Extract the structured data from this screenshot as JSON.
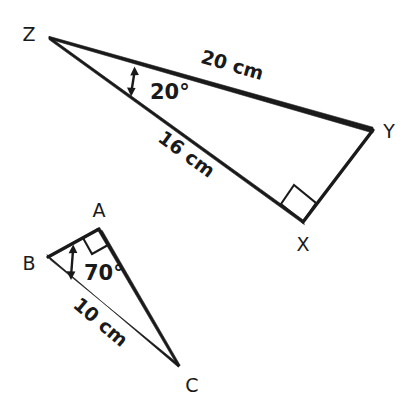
{
  "figure": {
    "background_color": "#ffffff",
    "ink_color": "#1a1a1a",
    "triangles": [
      {
        "id": "XYZ",
        "vertices": [
          {
            "name": "Z",
            "label": "Z",
            "x": 49,
            "y": 37,
            "label_x": 29,
            "label_y": 35
          },
          {
            "name": "Y",
            "label": "Y",
            "x": 373,
            "y": 130,
            "label_x": 389,
            "label_y": 132
          },
          {
            "name": "X",
            "label": "X",
            "x": 303,
            "y": 222,
            "label_x": 303,
            "label_y": 245
          }
        ],
        "sides": [
          {
            "from": "Z",
            "to": "Y",
            "label": "20 cm",
            "label_x": 232,
            "label_y": 66,
            "rotation": 16.0
          },
          {
            "from": "Z",
            "to": "X",
            "label": "16 cm",
            "label_x": 186,
            "label_y": 155,
            "rotation": 36.0
          },
          {
            "from": "X",
            "to": "Y",
            "label": "",
            "label_x": 0,
            "label_y": 0,
            "rotation": 0
          }
        ],
        "angles": [
          {
            "at": "Z",
            "label": "20°",
            "label_x": 150,
            "label_y": 93,
            "marker": "double-arrow"
          },
          {
            "at": "X",
            "label": "",
            "marker": "right-angle-square"
          }
        ]
      },
      {
        "id": "ABC",
        "vertices": [
          {
            "name": "A",
            "label": "A",
            "x": 99,
            "y": 229,
            "label_x": 99,
            "label_y": 216
          },
          {
            "name": "B",
            "label": "B",
            "x": 48,
            "y": 257,
            "label_x": 29,
            "label_y": 264
          },
          {
            "name": "C",
            "label": "C",
            "x": 179,
            "y": 366,
            "label_x": 192,
            "label_y": 388
          }
        ],
        "sides": [
          {
            "from": "B",
            "to": "A",
            "label": "",
            "label_x": 0,
            "label_y": 0,
            "rotation": 0
          },
          {
            "from": "A",
            "to": "C",
            "label": "",
            "label_x": 0,
            "label_y": 0,
            "rotation": 0
          },
          {
            "from": "B",
            "to": "C",
            "label": "10 cm",
            "label_x": 100,
            "label_y": 323,
            "rotation": 40.0
          }
        ],
        "angles": [
          {
            "at": "B",
            "label": "70°",
            "label_x": 86,
            "label_y": 276,
            "marker": "double-arrow"
          },
          {
            "at": "A",
            "label": "",
            "marker": "right-angle-square"
          }
        ]
      }
    ]
  }
}
